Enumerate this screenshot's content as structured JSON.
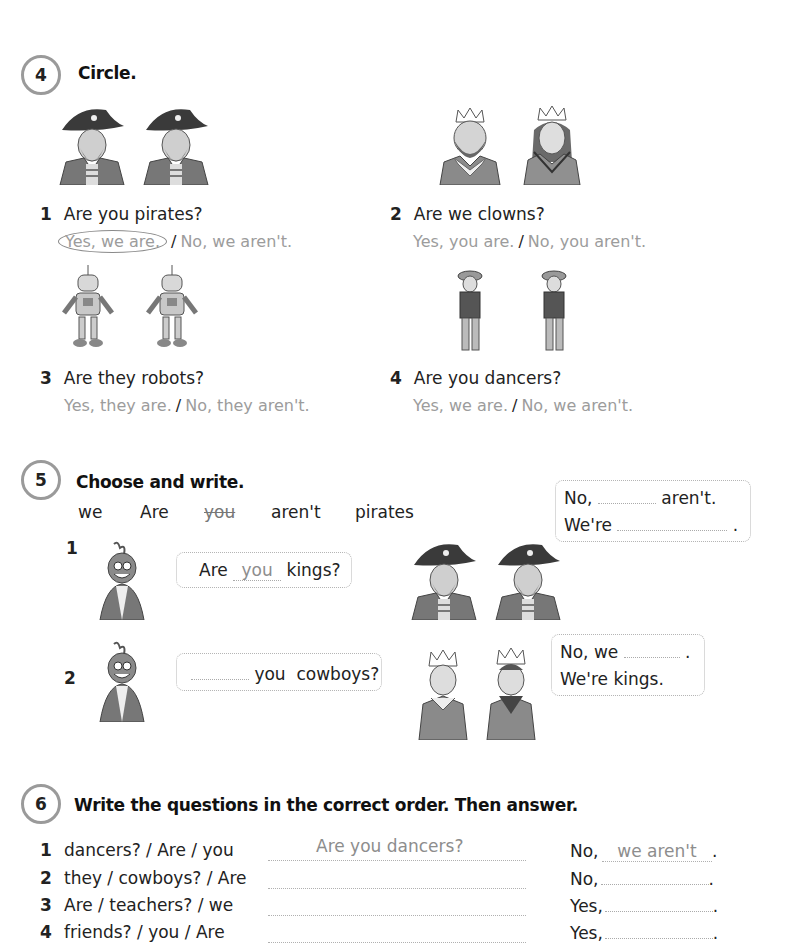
{
  "exercise4": {
    "number": "4",
    "title": "Circle.",
    "items": [
      {
        "num": "1",
        "question": "Are you pirates?",
        "option_yes": "Yes, we are.",
        "option_no": "No, we aren't.",
        "picture": "two-pirates",
        "circled": "yes"
      },
      {
        "num": "2",
        "question": "Are we clowns?",
        "option_yes": "Yes, you are.",
        "option_no": "No, you aren't.",
        "picture": "king-and-queen"
      },
      {
        "num": "3",
        "question": "Are they robots?",
        "option_yes": "Yes, they are.",
        "option_no": "No, they aren't.",
        "picture": "two-robots"
      },
      {
        "num": "4",
        "question": "Are you dancers?",
        "option_yes": "Yes, we are.",
        "option_no": "No, we aren't.",
        "picture": "two-cowboys"
      }
    ],
    "slash": "/"
  },
  "exercise5": {
    "number": "5",
    "title": "Choose and write.",
    "word_bank": [
      "we",
      "Are",
      "you",
      "aren't",
      "pirates"
    ],
    "crossed_word": "you",
    "items": [
      {
        "num": "1",
        "question_prefix": "Are",
        "question_filled": "you",
        "question_suffix": "kings?",
        "reply_line1_prefix": "No,",
        "reply_line1_suffix": "aren't.",
        "reply_line2_prefix": "We're",
        "reply_line2_suffix": "."
      },
      {
        "num": "2",
        "question_suffix": "you  cowboys?",
        "reply_line1_prefix": "No, we",
        "reply_line1_suffix": ".",
        "reply_line2": "We're kings."
      }
    ]
  },
  "exercise6": {
    "number": "6",
    "title": "Write the questions in the correct order. Then answer.",
    "rows": [
      {
        "num": "1",
        "prompt": "dancers? / Are / you",
        "written": "Are you dancers?",
        "answer_prefix": "No,",
        "answer_filled": "we aren't",
        "end": "."
      },
      {
        "num": "2",
        "prompt": "they / cowboys? / Are",
        "written": "",
        "answer_prefix": "No,",
        "answer_filled": "",
        "end": "."
      },
      {
        "num": "3",
        "prompt": "Are / teachers? / we",
        "written": "",
        "answer_prefix": "Yes,",
        "answer_filled": "",
        "end": "."
      },
      {
        "num": "4",
        "prompt": "friends? / you / Are",
        "written": "",
        "answer_prefix": "Yes,",
        "answer_filled": "",
        "end": "."
      }
    ]
  }
}
